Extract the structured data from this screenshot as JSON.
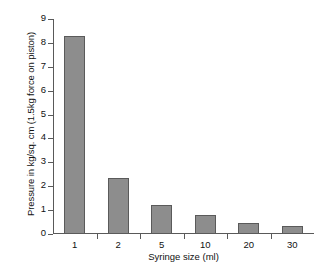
{
  "chart_data": {
    "type": "bar",
    "title": "",
    "categories": [
      "1",
      "2",
      "5",
      "10",
      "20",
      "30"
    ],
    "values": [
      8.3,
      2.35,
      1.2,
      0.8,
      0.47,
      0.32
    ],
    "series": [
      {
        "name": "Pressure",
        "values": [
          8.3,
          2.35,
          1.2,
          0.8,
          0.47,
          0.32
        ]
      }
    ],
    "xlabel": "Syringe size (ml)",
    "ylabel": "Pressure in kg/sq. cm (1.5kg force on piston)",
    "ylim": [
      0,
      9
    ],
    "yticks": [
      "0",
      "1",
      "2",
      "3",
      "4",
      "5",
      "6",
      "7",
      "8",
      "9"
    ],
    "grid": false,
    "legend": false,
    "legend_position": "none",
    "bar_color": "#8d8d8d",
    "bar_border_color": "#5a5a5a",
    "axis_color": "#595959",
    "text_color": "#111111",
    "background": "#ffffff"
  }
}
